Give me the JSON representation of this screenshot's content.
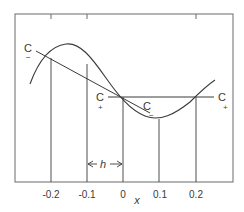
{
  "figure": {
    "xlabel": "x",
    "ticks": [
      {
        "value": -0.2,
        "label": "-0.2"
      },
      {
        "value": -0.1,
        "label": "-0.1"
      },
      {
        "value": 0,
        "label": "0"
      },
      {
        "value": 0.1,
        "label": "0.1"
      },
      {
        "value": 0.2,
        "label": "0.2"
      }
    ],
    "interval_label": "h",
    "labels": {
      "c_minus_left": {
        "main": "C",
        "sub": "−"
      },
      "c_plus_left": {
        "main": "C",
        "sub": "+"
      },
      "c_minus_right": {
        "main": "C",
        "sub": "−"
      },
      "c_plus_right": {
        "main": "C",
        "sub": "+"
      }
    },
    "colors": {
      "line": "#3a3a3a",
      "frame": "#6a6a6a"
    }
  }
}
